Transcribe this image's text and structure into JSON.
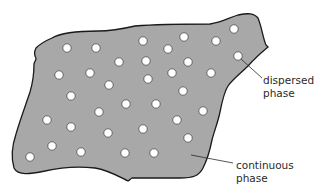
{
  "diagram": {
    "kind": "colloid / dispersion schematic",
    "colors": {
      "continuous_fill": "#a8a8a8",
      "outline": "#1a1a1a",
      "particle_fill": "#ffffff",
      "particle_stroke": "#3a3a3a",
      "leader_line": "#2a2a2a",
      "text": "#2a2a2a"
    },
    "labels": {
      "dispersed": {
        "line1": "dispersed",
        "line2": "phase"
      },
      "continuous": {
        "line1": "continuous",
        "line2": "phase"
      }
    },
    "particle_radius": 4.2,
    "particles": [
      [
        67,
        48
      ],
      [
        96,
        48
      ],
      [
        143,
        41
      ],
      [
        168,
        49
      ],
      [
        184,
        37
      ],
      [
        216,
        41
      ],
      [
        234,
        29
      ],
      [
        119,
        62
      ],
      [
        146,
        61
      ],
      [
        188,
        62
      ],
      [
        238,
        56
      ],
      [
        59,
        75
      ],
      [
        90,
        73
      ],
      [
        148,
        79
      ],
      [
        172,
        73
      ],
      [
        211,
        73
      ],
      [
        109,
        85
      ],
      [
        183,
        91
      ],
      [
        71,
        96
      ],
      [
        126,
        104
      ],
      [
        156,
        104
      ],
      [
        99,
        112
      ],
      [
        203,
        111
      ],
      [
        47,
        120
      ],
      [
        177,
        120
      ],
      [
        71,
        127
      ],
      [
        143,
        129
      ],
      [
        108,
        133
      ],
      [
        188,
        138
      ],
      [
        52,
        146
      ],
      [
        81,
        152
      ],
      [
        125,
        153
      ],
      [
        154,
        153
      ],
      [
        30,
        157
      ]
    ]
  }
}
